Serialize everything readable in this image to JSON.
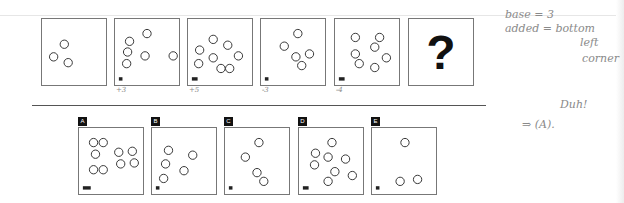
{
  "question": {
    "sequence_panels": [
      {
        "id": "p1",
        "circles": [
          [
            23,
            26
          ],
          [
            12,
            39
          ],
          [
            27,
            45
          ]
        ],
        "marker": "",
        "annotation": ""
      },
      {
        "id": "p2",
        "circles": [
          [
            33,
            15
          ],
          [
            15,
            23
          ],
          [
            13,
            34
          ],
          [
            31,
            38
          ],
          [
            60,
            38
          ],
          [
            12,
            46
          ]
        ],
        "marker": "I",
        "annotation": "+3"
      },
      {
        "id": "p3",
        "circles": [
          [
            26,
            21
          ],
          [
            41,
            27
          ],
          [
            12,
            32
          ],
          [
            52,
            38
          ],
          [
            26,
            40
          ],
          [
            11,
            46
          ],
          [
            34,
            51
          ],
          [
            43,
            51
          ]
        ],
        "marker": "II",
        "annotation": "+5"
      },
      {
        "id": "p4",
        "circles": [
          [
            38,
            15
          ],
          [
            24,
            28
          ],
          [
            36,
            39
          ],
          [
            50,
            36
          ],
          [
            42,
            48
          ]
        ],
        "marker": "I",
        "annotation": "-3"
      },
      {
        "id": "p5",
        "circles": [
          [
            21,
            19
          ],
          [
            46,
            19
          ],
          [
            41,
            29
          ],
          [
            21,
            36
          ],
          [
            53,
            40
          ],
          [
            25,
            46
          ],
          [
            41,
            50
          ]
        ],
        "marker": "II",
        "annotation": "-4"
      }
    ],
    "unknown_panel": {
      "symbol": "?"
    }
  },
  "answers": {
    "options": [
      {
        "label": "A",
        "circles": [
          [
            15,
            15
          ],
          [
            25,
            15
          ],
          [
            17,
            27
          ],
          [
            41,
            25
          ],
          [
            55,
            24
          ],
          [
            43,
            37
          ],
          [
            57,
            36
          ],
          [
            15,
            43
          ],
          [
            25,
            43
          ]
        ],
        "marker": "III"
      },
      {
        "label": "B",
        "circles": [
          [
            17,
            23
          ],
          [
            42,
            28
          ],
          [
            14,
            37
          ],
          [
            33,
            44
          ],
          [
            12,
            52
          ]
        ],
        "marker": "I"
      },
      {
        "label": "C",
        "circles": [
          [
            35,
            15
          ],
          [
            21,
            30
          ],
          [
            33,
            46
          ],
          [
            40,
            55
          ]
        ],
        "marker": "I"
      },
      {
        "label": "D",
        "circles": [
          [
            34,
            15
          ],
          [
            17,
            26
          ],
          [
            30,
            30
          ],
          [
            48,
            32
          ],
          [
            16,
            38
          ],
          [
            37,
            45
          ],
          [
            55,
            49
          ],
          [
            30,
            55
          ]
        ],
        "marker": "II"
      },
      {
        "label": "E",
        "circles": [
          [
            34,
            15
          ],
          [
            29,
            55
          ],
          [
            47,
            53
          ]
        ],
        "marker": "I"
      }
    ]
  },
  "handwritten_notes": {
    "line1": "base = 3",
    "line2": "added = bottom",
    "line3": "left",
    "line4": "corner",
    "answer": "⇒ (A).",
    "exclaim": "Duh!"
  }
}
